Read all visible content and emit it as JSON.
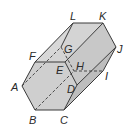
{
  "diagram": {
    "type": "hexagonal-prism",
    "fill_color": "#cfcfcf",
    "edge_color": "#3a3a3a",
    "vertices": {
      "A": {
        "label": "A",
        "x": 22,
        "y": 86,
        "lx": 11,
        "ly": 91
      },
      "B": {
        "label": "B",
        "x": 35,
        "y": 110,
        "lx": 29,
        "ly": 124
      },
      "C": {
        "label": "C",
        "x": 64,
        "y": 110,
        "lx": 60,
        "ly": 124
      },
      "D": {
        "label": "D",
        "x": 77,
        "y": 85,
        "lx": 67,
        "ly": 93
      },
      "E": {
        "label": "E",
        "x": 65,
        "y": 62,
        "lx": 56,
        "ly": 74
      },
      "F": {
        "label": "F",
        "x": 35,
        "y": 62,
        "lx": 29,
        "ly": 60
      },
      "G": {
        "label": "G",
        "x": 61,
        "y": 47,
        "lx": 64,
        "ly": 53
      },
      "H": {
        "label": "H",
        "x": 74,
        "y": 71,
        "lx": 76,
        "ly": 70
      },
      "I": {
        "label": "I",
        "x": 103,
        "y": 71,
        "lx": 105,
        "ly": 80
      },
      "J": {
        "label": "J",
        "x": 116,
        "y": 47,
        "lx": 117,
        "ly": 53
      },
      "K": {
        "label": "K",
        "x": 103,
        "y": 23,
        "lx": 99,
        "ly": 20
      },
      "L": {
        "label": "L",
        "x": 73,
        "y": 23,
        "lx": 70,
        "ly": 20
      }
    },
    "labels": [
      "A",
      "B",
      "C",
      "D",
      "E",
      "F",
      "G",
      "H",
      "I",
      "J",
      "K",
      "L"
    ]
  }
}
